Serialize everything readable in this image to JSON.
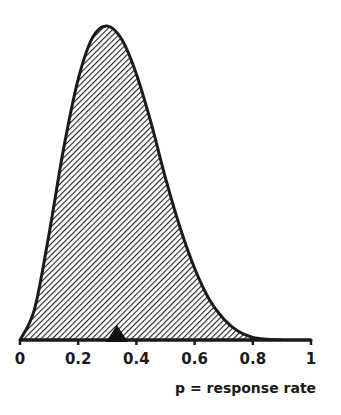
{
  "chart_data": {
    "type": "area",
    "title": "",
    "xlabel": "p = response rate",
    "ylabel": "",
    "xlim": [
      0,
      1
    ],
    "grid": false,
    "legend": null,
    "tick_labels": [
      "0",
      "0.2",
      "0.4",
      "0.6",
      "0.8",
      "1"
    ],
    "ticks": [
      0,
      0.2,
      0.4,
      0.6,
      0.8,
      1
    ],
    "series": [
      {
        "name": "density",
        "x": [
          0,
          0.05,
          0.1,
          0.15,
          0.2,
          0.25,
          0.3,
          0.35,
          0.4,
          0.45,
          0.5,
          0.55,
          0.6,
          0.65,
          0.7,
          0.75,
          0.8,
          0.85,
          0.9,
          0.95,
          1
        ],
        "values": [
          0,
          0.25,
          0.86,
          1.55,
          2.11,
          2.45,
          2.54,
          2.43,
          2.15,
          1.76,
          1.31,
          0.91,
          0.58,
          0.33,
          0.17,
          0.07,
          0.02,
          0.006,
          0.001,
          0,
          0
        ]
      }
    ],
    "annotations": [
      {
        "type": "triangle-marker",
        "x": 0.333,
        "label": "mean"
      }
    ]
  },
  "style": {
    "ink": "#1a1a1a",
    "background": "#ffffff"
  }
}
